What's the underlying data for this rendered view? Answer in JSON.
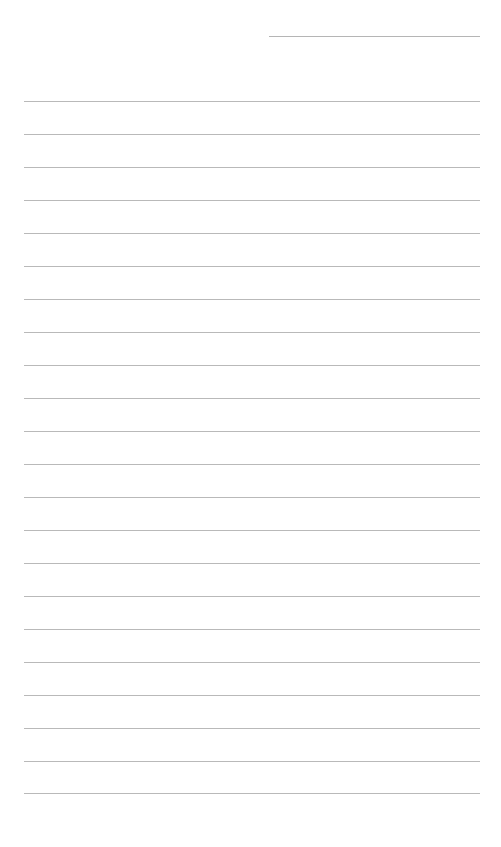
{
  "page": {
    "type": "blank-lined-sheet",
    "background": "#ffffff",
    "line_color": "#b9b9b9"
  },
  "header_line": {
    "x1": 269,
    "x2": 480,
    "y": 36
  },
  "ruled_lines": {
    "x1": 24,
    "x2": 480,
    "y_positions": [
      101,
      134,
      167,
      200,
      233,
      266,
      299,
      332,
      365,
      398,
      431,
      464,
      497,
      530,
      563,
      596,
      629,
      662,
      695,
      728,
      761,
      793
    ]
  }
}
